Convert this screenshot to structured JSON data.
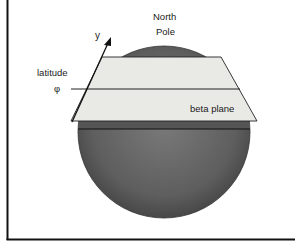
{
  "diagram": {
    "labels": {
      "north": "North",
      "pole": "Pole",
      "y_axis": "y",
      "latitude": "latitude",
      "phi": "φ",
      "beta_plane": "beta plane"
    },
    "colors": {
      "sphere": "#6b6b6b",
      "sphere_dark": "#4a4a4a",
      "plane": "#e9e9e6",
      "line": "#1a1a1a",
      "border": "#111111"
    }
  }
}
